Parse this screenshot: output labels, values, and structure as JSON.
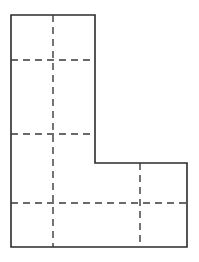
{
  "figure": {
    "type": "technical-line-drawing",
    "canvas": {
      "width": 199,
      "height": 262,
      "background": "#ffffff"
    },
    "styles": {
      "outline_color": "#2b2b2b",
      "outline_width": 1.6,
      "hidden_line_color": "#3a3a3a",
      "hidden_line_width": 1.4,
      "hidden_dash_pattern": "7 5"
    },
    "outline": {
      "label": "L-shape outline",
      "points": "11,15 95,15 95,163 187,163 187,247 11,247",
      "vertices": [
        {
          "name": "top-left",
          "x": 11,
          "y": 15
        },
        {
          "name": "top-right-of-upper-arm",
          "x": 95,
          "y": 15
        },
        {
          "name": "inner-step-corner",
          "x": 95,
          "y": 163
        },
        {
          "name": "top-right-of-lower-arm",
          "x": 187,
          "y": 163
        },
        {
          "name": "bottom-right",
          "x": 187,
          "y": 247
        },
        {
          "name": "bottom-left",
          "x": 11,
          "y": 247
        }
      ]
    },
    "hidden_lines": [
      {
        "name": "vertical-center-line-left",
        "orientation": "vertical",
        "x1": 53,
        "y1": 15,
        "x2": 53,
        "y2": 247
      },
      {
        "name": "vertical-center-line-right",
        "orientation": "vertical",
        "x1": 140,
        "y1": 163,
        "x2": 140,
        "y2": 247
      },
      {
        "name": "horizontal-line-upper",
        "orientation": "horizontal",
        "x1": 11,
        "y1": 60,
        "x2": 95,
        "y2": 60
      },
      {
        "name": "horizontal-line-middle",
        "orientation": "horizontal",
        "x1": 11,
        "y1": 134,
        "x2": 95,
        "y2": 134
      },
      {
        "name": "horizontal-line-lower",
        "orientation": "horizontal",
        "x1": 11,
        "y1": 203,
        "x2": 187,
        "y2": 203
      }
    ]
  }
}
